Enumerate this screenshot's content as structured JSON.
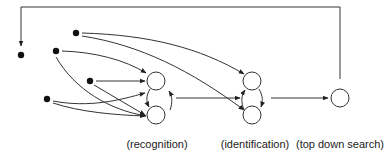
{
  "diagram": {
    "type": "network",
    "colors": {
      "stroke": "#333333",
      "node_fill": "#ffffff",
      "dot_fill": "#111111",
      "text": "#222222"
    },
    "input_dots": [
      {
        "id": "A",
        "cx": 21,
        "cy": 55
      },
      {
        "id": "B",
        "cx": 76,
        "cy": 33
      },
      {
        "id": "C",
        "cx": 56,
        "cy": 51
      },
      {
        "id": "D",
        "cx": 90,
        "cy": 81
      },
      {
        "id": "E",
        "cx": 47,
        "cy": 99
      }
    ],
    "nodes": [
      {
        "id": "rec_top",
        "cx": 156,
        "cy": 81,
        "r": 9
      },
      {
        "id": "rec_bottom",
        "cx": 156,
        "cy": 115,
        "r": 9
      },
      {
        "id": "id_top",
        "cx": 252,
        "cy": 81,
        "r": 9
      },
      {
        "id": "id_bottom",
        "cx": 252,
        "cy": 115,
        "r": 9
      },
      {
        "id": "search",
        "cx": 340,
        "cy": 98,
        "r": 9
      }
    ],
    "labels": {
      "recognition": "(recognition)",
      "identification": "(identification)",
      "top_down_search": "(top down search)"
    }
  }
}
